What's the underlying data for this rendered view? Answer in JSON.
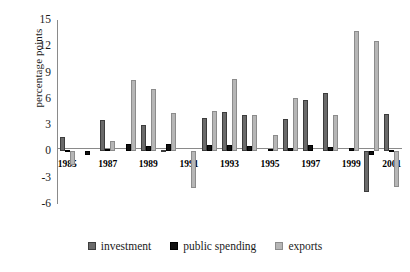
{
  "chart_data": {
    "type": "bar",
    "title": "",
    "subtitle": "",
    "xlabel": "",
    "ylabel": "percentage points",
    "ylim": [
      -6,
      15
    ],
    "yticks": [
      15,
      12,
      9,
      6,
      3,
      0,
      -3,
      -6
    ],
    "grid": false,
    "legend_position": "bottom",
    "categories": [
      "1985",
      "1986",
      "1987",
      "1988",
      "1989",
      "1990",
      "1991",
      "1992",
      "1993",
      "1994",
      "1995",
      "1996",
      "1997",
      "1998",
      "1999",
      "2000",
      "2001"
    ],
    "xtick_labels": [
      "1985",
      "1987",
      "1989",
      "1991",
      "1993",
      "1995",
      "1997",
      "1999",
      "2001"
    ],
    "series": [
      {
        "name": "investment",
        "color": "#6a6a6a",
        "values": [
          1.6,
          0.0,
          3.6,
          0.0,
          3.0,
          0.2,
          0.0,
          3.8,
          4.5,
          4.2,
          0.0,
          3.7,
          5.9,
          6.7,
          0.0,
          -4.6,
          4.3
        ]
      },
      {
        "name": "public spending",
        "color": "#111111",
        "values": [
          0.2,
          -0.4,
          0.3,
          0.9,
          0.6,
          0.9,
          0.0,
          0.7,
          0.7,
          0.6,
          0.3,
          0.4,
          0.7,
          0.5,
          0.4,
          -0.4,
          0.2
        ]
      },
      {
        "name": "exports",
        "color": "#b6b6b6",
        "values": [
          -1.5,
          0.0,
          1.2,
          8.2,
          7.1,
          4.4,
          -4.2,
          4.6,
          8.3,
          4.2,
          1.9,
          6.1,
          0.0,
          4.2,
          13.7,
          12.6,
          -4.1
        ]
      }
    ],
    "legend": [
      {
        "label": "investment",
        "swatch": "investment"
      },
      {
        "label": "public spending",
        "swatch": "spending"
      },
      {
        "label": "exports",
        "swatch": "exports"
      }
    ]
  }
}
